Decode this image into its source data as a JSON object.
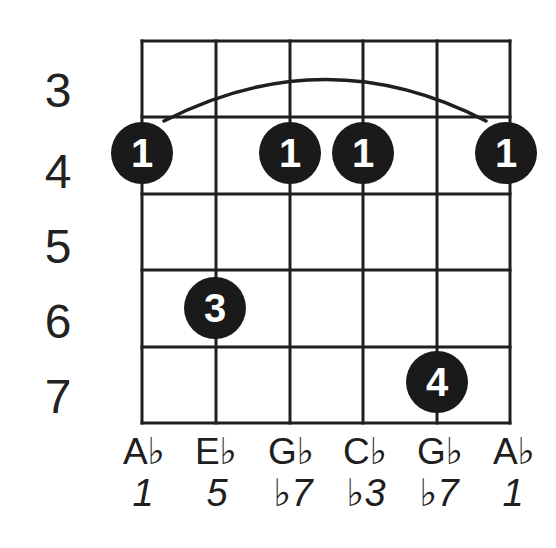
{
  "diagram": {
    "type": "guitar-chord-diagram",
    "fret_labels": [
      "3",
      "4",
      "5",
      "6",
      "7"
    ],
    "barre": {
      "finger": "1",
      "fret": "4",
      "from_string_index": 0,
      "to_string_index": 5
    },
    "dots": [
      {
        "finger": "1",
        "string_index": 0,
        "fret": "4"
      },
      {
        "finger": "1",
        "string_index": 2,
        "fret": "4"
      },
      {
        "finger": "1",
        "string_index": 3,
        "fret": "4"
      },
      {
        "finger": "1",
        "string_index": 5,
        "fret": "4"
      },
      {
        "finger": "3",
        "string_index": 1,
        "fret": "6"
      },
      {
        "finger": "4",
        "string_index": 4,
        "fret": "7"
      }
    ],
    "notes": [
      {
        "name": "A♭",
        "degree": "1"
      },
      {
        "name": "E♭",
        "degree": "5"
      },
      {
        "name": "G♭",
        "degree": "♭7"
      },
      {
        "name": "C♭",
        "degree": "♭3"
      },
      {
        "name": "G♭",
        "degree": "♭7"
      },
      {
        "name": "A♭",
        "degree": "1"
      }
    ],
    "colors": {
      "ink": "#1e1e1e",
      "background": "#ffffff",
      "dot_fill": "#1a1a1a",
      "dot_text": "#ffffff"
    }
  }
}
